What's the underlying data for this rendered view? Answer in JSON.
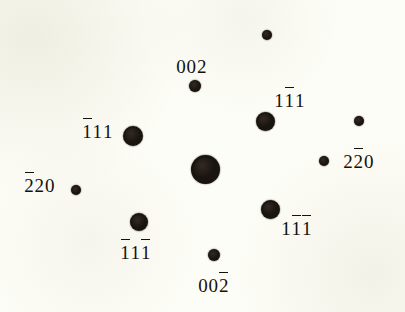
{
  "figure": {
    "kind": "electron-diffraction-pattern",
    "background_color": "#fdfdf7",
    "spot_color": "#1a1410",
    "width": 405,
    "height": 312
  },
  "chart_data": {
    "type": "scatter",
    "title": "",
    "xlabel": "",
    "ylabel": "",
    "xlim": [
      0,
      405
    ],
    "ylim": [
      0,
      312
    ],
    "grid": false,
    "legend": null,
    "note": "Indexed single-crystal electron diffraction spot pattern; marker radius encodes relative spot intensity. Overbars denote negative Miller indices.",
    "points": [
      {
        "id": "p-unlabeled-top",
        "label": "",
        "digits": [],
        "x": 267,
        "y": 35,
        "r": 5.2
      },
      {
        "id": "p-002",
        "label": "002",
        "digits": [
          "0",
          "0",
          "2"
        ],
        "bars": [
          false,
          false,
          false
        ],
        "x": 195,
        "y": 86,
        "r": 6.0,
        "label_x": 176,
        "label_y": 57
      },
      {
        "id": "p-1b11",
        "label": "1̄11",
        "digits": [
          "1",
          "1",
          "1"
        ],
        "bars": [
          false,
          true,
          false
        ],
        "x": 265,
        "y": 121,
        "r": 9.5,
        "label_x": 274,
        "label_y": 91
      },
      {
        "id": "p-unlabeled-right",
        "label": "",
        "digits": [],
        "x": 359,
        "y": 121,
        "r": 5.0
      },
      {
        "id": "p-b111",
        "label": "1̄11",
        "digits": [
          "1",
          "1",
          "1"
        ],
        "bars": [
          true,
          false,
          false
        ],
        "x": 133,
        "y": 136,
        "r": 10.0,
        "label_x": 82,
        "label_y": 122
      },
      {
        "id": "p-2b20",
        "label": "22̄0",
        "digits": [
          "2",
          "2",
          "0"
        ],
        "bars": [
          false,
          true,
          false
        ],
        "x": 324,
        "y": 161,
        "r": 5.4,
        "label_x": 343,
        "label_y": 152
      },
      {
        "id": "p-000",
        "label": "",
        "digits": [],
        "x": 205,
        "y": 169,
        "r": 14.5
      },
      {
        "id": "p-b220",
        "label": "2̄20",
        "digits": [
          "2",
          "2",
          "0"
        ],
        "bars": [
          true,
          false,
          false
        ],
        "x": 76,
        "y": 190,
        "r": 5.4,
        "label_x": 24,
        "label_y": 176
      },
      {
        "id": "p-1b1b1",
        "label": "11̄1̄",
        "digits": [
          "1",
          "1",
          "1"
        ],
        "bars": [
          false,
          true,
          true
        ],
        "x": 270,
        "y": 209,
        "r": 9.5,
        "label_x": 281,
        "label_y": 219
      },
      {
        "id": "p-b11b1",
        "label": "1̄11̄",
        "digits": [
          "1",
          "1",
          "1"
        ],
        "bars": [
          true,
          false,
          true
        ],
        "x": 139,
        "y": 222,
        "r": 9.0,
        "label_x": 120,
        "label_y": 243
      },
      {
        "id": "p-002b",
        "label": "002̄",
        "digits": [
          "0",
          "0",
          "2"
        ],
        "bars": [
          false,
          false,
          true
        ],
        "x": 214,
        "y": 255,
        "r": 6.0,
        "label_x": 198,
        "label_y": 276
      }
    ]
  }
}
